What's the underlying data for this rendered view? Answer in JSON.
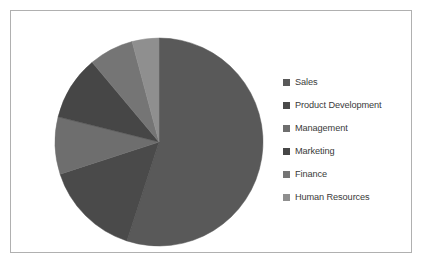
{
  "chart_data": {
    "type": "pie",
    "title": "",
    "legend_position": "right",
    "grid": false,
    "categories": [
      "Sales",
      "Product Development",
      "Management",
      "Marketing",
      "Finance",
      "Human Resources"
    ],
    "values": [
      55,
      15,
      9,
      10,
      7,
      4
    ],
    "slices": [
      {
        "label": "Sales",
        "value": 55,
        "start_angle": 0,
        "end_angle": 198,
        "color": "#595959"
      },
      {
        "label": "Product Development",
        "value": 15,
        "start_angle": 198,
        "end_angle": 252,
        "color": "#4a4a4a"
      },
      {
        "label": "Management",
        "value": 9,
        "start_angle": 252,
        "end_angle": 284,
        "color": "#6e6e6e"
      },
      {
        "label": "Marketing",
        "value": 10,
        "start_angle": 284,
        "end_angle": 320,
        "color": "#464646"
      },
      {
        "label": "Finance",
        "value": 7,
        "start_angle": 320,
        "end_angle": 345,
        "color": "#757575"
      },
      {
        "label": "Human Resources",
        "value": 4,
        "start_angle": 345,
        "end_angle": 360,
        "color": "#8f8f8f"
      }
    ],
    "geometry": {
      "cx": 148,
      "cy": 131,
      "r": 104
    }
  },
  "legend": {
    "items": [
      {
        "label": "Sales",
        "color": "#595959"
      },
      {
        "label": "Product Development",
        "color": "#4a4a4a"
      },
      {
        "label": "Management",
        "color": "#6e6e6e"
      },
      {
        "label": "Marketing",
        "color": "#464646"
      },
      {
        "label": "Finance",
        "color": "#757575"
      },
      {
        "label": "Human Resources",
        "color": "#8f8f8f"
      }
    ]
  },
  "frame": {
    "border_color": "#b0b0b0",
    "background": "#ffffff"
  }
}
